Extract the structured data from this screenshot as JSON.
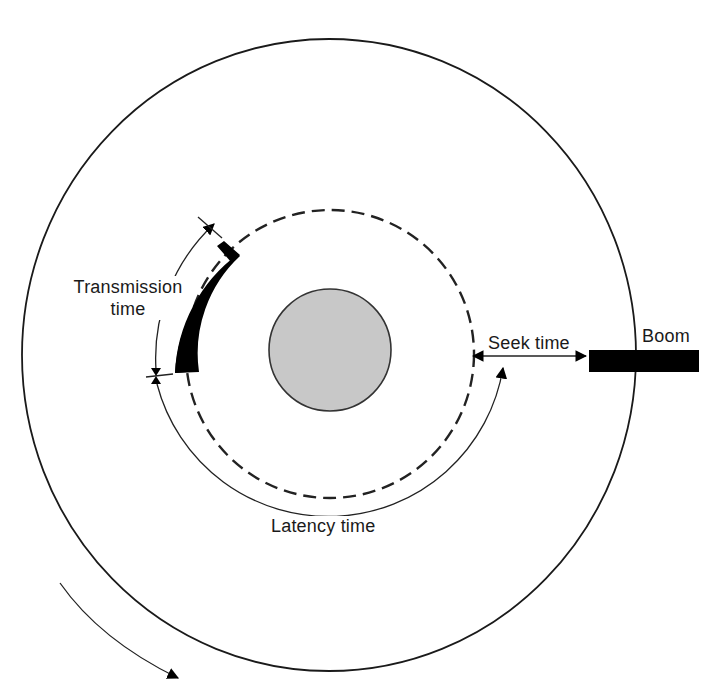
{
  "diagram": {
    "type": "disk-access-time",
    "labels": {
      "transmission_line1": "Transmission",
      "transmission_line2": "time",
      "seek": "Seek time",
      "boom": "Boom",
      "latency": "Latency time"
    },
    "components": {
      "platter": "outer-disk-circle",
      "hub": "center-hub",
      "track": "dashed-track",
      "record": "black-record-block",
      "boom_arm": "black-boom-bar",
      "rotation": "clockwise-rotation-arrow"
    },
    "colors": {
      "line": "#1a1a1a",
      "hub_fill": "#c8c8c8",
      "record_fill": "#000000",
      "background": "#ffffff"
    }
  }
}
